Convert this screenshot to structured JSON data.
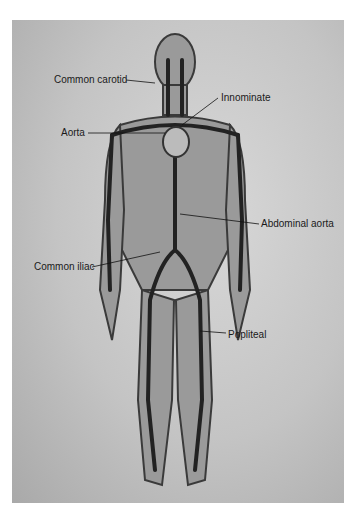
{
  "diagram": {
    "labels": [
      {
        "id": "common-carotid",
        "text": "Common carotid",
        "x": 54,
        "y": 75
      },
      {
        "id": "innominate",
        "text": "Innominate",
        "x": 221,
        "y": 93
      },
      {
        "id": "aorta",
        "text": "Aorta",
        "x": 61,
        "y": 128
      },
      {
        "id": "abdominal-aorta",
        "text": "Abdominal aorta",
        "x": 261,
        "y": 219
      },
      {
        "id": "common-iliac",
        "text": "Common iliac",
        "x": 34,
        "y": 262
      },
      {
        "id": "popliteal",
        "text": "Popliteal",
        "x": 228,
        "y": 330
      }
    ],
    "colors": {
      "background": "#c4c4c4",
      "vessel": "#2a2a2a",
      "skin": "#8a8a8a",
      "label": "#1a1a1a"
    }
  }
}
